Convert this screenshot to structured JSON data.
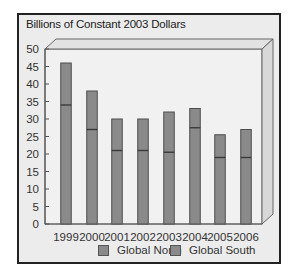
{
  "chart_data": {
    "type": "bar",
    "stacked": true,
    "title": "Billions of Constant 2003 Dollars",
    "xlabel": "",
    "ylabel": "Billions of Constant 2003 Dollars",
    "ylim": [
      0,
      50
    ],
    "yticks": [
      0,
      5,
      10,
      15,
      20,
      25,
      30,
      35,
      40,
      45,
      50
    ],
    "categories": [
      "1999",
      "2000",
      "2001",
      "2002",
      "2003",
      "2004",
      "2005",
      "2006"
    ],
    "series": [
      {
        "name": "Global North",
        "values": [
          34,
          27,
          21,
          21,
          20.5,
          27.5,
          19,
          19
        ]
      },
      {
        "name": "Global South",
        "values": [
          12,
          11,
          9,
          9,
          11.5,
          5.5,
          6.5,
          8
        ]
      }
    ],
    "totals": [
      46,
      38,
      30,
      30,
      32,
      33,
      25.5,
      27
    ],
    "legend_position": "bottom",
    "grid": false,
    "style": "3d-box"
  },
  "colors": {
    "bar": "#8a8a8a",
    "bar_border": "#4d4d4d",
    "divider": "#3a3a3a",
    "background": "#ececec",
    "frame": "#222222"
  },
  "legend": {
    "north_label": "Global North",
    "south_label": "Global South"
  }
}
